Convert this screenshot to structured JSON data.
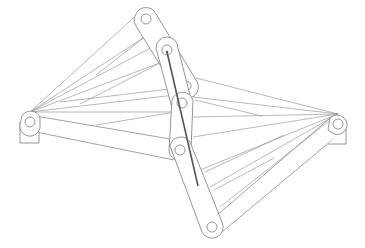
{
  "diagram": {
    "title": "",
    "type": "linkage-mechanism",
    "colors": {
      "line": "#8a8a8a",
      "rod": "#555555",
      "background": "#ffffff"
    },
    "pivots": {
      "left_base": [
        30,
        122
      ],
      "right_base": [
        338,
        124
      ],
      "top": [
        146,
        19
      ],
      "upper": [
        167,
        50
      ],
      "mid_right": [
        186,
        86
      ],
      "mid": [
        182,
        103
      ],
      "lower": [
        180,
        150
      ],
      "bottom": [
        212,
        227
      ]
    },
    "labels": []
  }
}
